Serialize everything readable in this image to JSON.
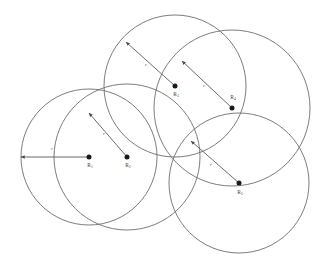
{
  "figure": {
    "background_color": "#ffffff",
    "stroke_color": "#6d6d6d",
    "dot_color": "#1a1a1a",
    "label_color": "#3b3b3b",
    "width": 325,
    "height": 274
  },
  "chart_data": {
    "type": "scatter",
    "title": "",
    "xlabel": "",
    "ylabel": "",
    "grid": false,
    "legend": null,
    "xlim": [
      0,
      325
    ],
    "ylim": [
      0,
      274
    ],
    "circles": [
      {
        "id": "circle-1",
        "label": "R",
        "subscript": "1",
        "center_x": 89,
        "center_y": 157,
        "radius": 68,
        "radius_label": "r",
        "arrow_tip_x": 21,
        "arrow_tip_y": 157,
        "radius_label_x": 52,
        "radius_label_y": 150,
        "node_label_x": 90,
        "node_label_y": 167
      },
      {
        "id": "circle-2",
        "label": "R",
        "subscript": "2",
        "center_x": 127,
        "center_y": 157,
        "radius": 73,
        "radius_label": "r",
        "arrow_tip_x": 89,
        "arrow_tip_y": 113,
        "radius_label_x": 104,
        "radius_label_y": 135,
        "node_label_x": 128,
        "node_label_y": 167
      },
      {
        "id": "circle-3",
        "label": "R",
        "subscript": "3",
        "center_x": 175,
        "center_y": 86,
        "radius": 71,
        "radius_label": "r",
        "arrow_tip_x": 126,
        "arrow_tip_y": 42,
        "radius_label_x": 146,
        "radius_label_y": 66,
        "node_label_x": 176,
        "node_label_y": 96
      },
      {
        "id": "circle-4",
        "label": "R",
        "subscript": "4",
        "center_x": 232,
        "center_y": 108,
        "radius": 78,
        "radius_label": "r",
        "arrow_tip_x": 182,
        "arrow_tip_y": 61,
        "radius_label_x": 204,
        "radius_label_y": 87,
        "node_label_x": 233,
        "node_label_y": 99
      },
      {
        "id": "circle-5",
        "label": "R",
        "subscript": "5",
        "center_x": 239,
        "center_y": 183,
        "radius": 70,
        "radius_label": "r",
        "arrow_tip_x": 191,
        "arrow_tip_y": 141,
        "radius_label_x": 211,
        "radius_label_y": 166,
        "node_label_x": 240,
        "node_label_y": 194
      }
    ]
  }
}
